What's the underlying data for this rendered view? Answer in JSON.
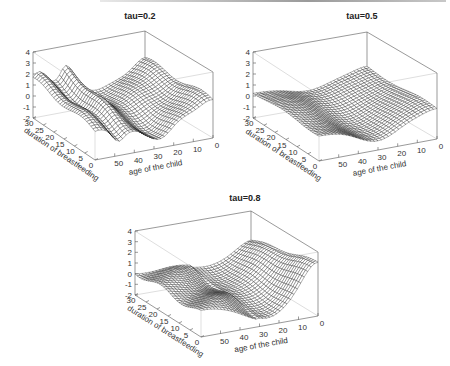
{
  "figure": {
    "header_bar": true
  },
  "chart_data": [
    {
      "type": "surface3d",
      "title": "tau=0.2",
      "xlabel": "age of the child",
      "ylabel": "duration of breastfeeding",
      "zlabel": "",
      "x_ticks": [
        0,
        10,
        20,
        30,
        40,
        50
      ],
      "y_ticks": [
        0,
        5,
        10,
        15,
        20,
        25,
        30
      ],
      "z_ticks": [
        -2,
        -1,
        0,
        1,
        2,
        3,
        4
      ],
      "xlim": [
        0,
        60
      ],
      "ylim": [
        0,
        30
      ],
      "zlim": [
        -2,
        4
      ],
      "grid": false,
      "box": true,
      "description": "Wavy surface: high (~1.8) at old age & long breastfeeding corner, ridge ~2 near age 45, trough ~-1.5 around age 25-30 mid breastfeeding, rising to ~1.5 at age 0."
    },
    {
      "type": "surface3d",
      "title": "tau=0.5",
      "xlabel": "age of the child",
      "ylabel": "duration of breastfeeding",
      "zlabel": "",
      "x_ticks": [
        0,
        10,
        20,
        30,
        40,
        50
      ],
      "y_ticks": [
        0,
        5,
        10,
        15,
        20,
        25,
        30
      ],
      "z_ticks": [
        -2,
        -1,
        0,
        1,
        2,
        3,
        4
      ],
      "xlim": [
        0,
        60
      ],
      "ylim": [
        0,
        30
      ],
      "zlim": [
        -2,
        4
      ],
      "grid": false,
      "box": true,
      "description": "Smooth shallow bowl, values roughly 0.5 at edges, dipping to about -1.5 at age 25-35, rising to ~0.7 at age 0."
    },
    {
      "type": "surface3d",
      "title": "tau=0.8",
      "xlabel": "age of the child",
      "ylabel": "duration of breastfeeding",
      "zlabel": "",
      "x_ticks": [
        0,
        10,
        20,
        30,
        40,
        50
      ],
      "y_ticks": [
        0,
        5,
        10,
        15,
        20,
        25,
        30
      ],
      "z_ticks": [
        -2,
        -1,
        0,
        1,
        2,
        3,
        4
      ],
      "xlim": [
        0,
        60
      ],
      "ylim": [
        0,
        30
      ],
      "zlim": [
        -2,
        4
      ],
      "grid": false,
      "box": true,
      "description": "Surface near 0.3 at old ages, dipping to ~-1.5 around age 25, rising steeply to ~3 at age 0 and short breastfeeding."
    }
  ]
}
